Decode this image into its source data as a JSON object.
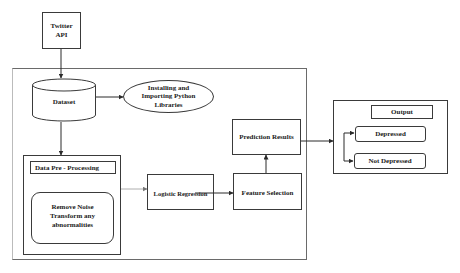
{
  "diagram": {
    "nodes": {
      "twitter_api": {
        "label": "Twitter API",
        "line1": "Twitter",
        "line2": "API"
      },
      "dataset": {
        "label": "Dataset"
      },
      "install_libraries": {
        "line1": "Installing and",
        "line2": "Importing Python",
        "line3": "Libraries"
      },
      "preprocessing": {
        "title": "Data Pre - Processing",
        "line1": "Remove Noise",
        "line2": "Transform any",
        "line3": "abnormalities"
      },
      "logistic_regression": {
        "label": "Logistic Regression"
      },
      "feature_selection": {
        "label": "Feature Selection"
      },
      "prediction_results": {
        "label": "Prediction Results"
      },
      "output": {
        "title": "Output",
        "classes": [
          "Depressed",
          "Not Depressed"
        ]
      }
    },
    "edges": [
      {
        "from": "Twitter API",
        "to": "Dataset"
      },
      {
        "from": "Dataset",
        "to": "Installing and Importing Python Libraries"
      },
      {
        "from": "Dataset",
        "to": "Data Pre - Processing"
      },
      {
        "from": "Data Pre - Processing",
        "to": "Logistic Regression"
      },
      {
        "from": "Logistic Regression",
        "to": "Feature Selection"
      },
      {
        "from": "Feature Selection",
        "to": "Prediction Results"
      },
      {
        "from": "Prediction Results",
        "to": "Output"
      },
      {
        "from": "Output",
        "to": "Depressed"
      },
      {
        "from": "Output",
        "to": "Not Depressed"
      }
    ]
  }
}
